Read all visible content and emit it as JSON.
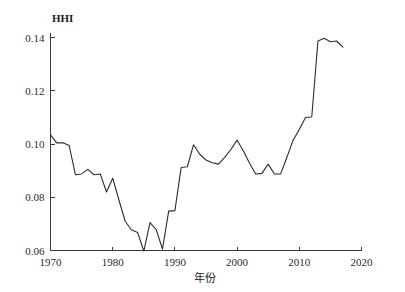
{
  "chart_data": {
    "type": "line",
    "title": "",
    "xlabel": "年份",
    "ylabel": "HHI",
    "xlim": [
      1970,
      2020
    ],
    "ylim": [
      0.06,
      0.142
    ],
    "grid": false,
    "legend": null,
    "x_ticks": [
      1970,
      1980,
      1990,
      2000,
      2010,
      2020
    ],
    "x_tick_labels": [
      "1970",
      "1980",
      "1990",
      "2000",
      "2010",
      "2020"
    ],
    "y_ticks": [
      0.06,
      0.08,
      0.1,
      0.12,
      0.14
    ],
    "y_tick_labels": [
      "0.06",
      "0.08",
      "0.10",
      "0.12",
      "0.14"
    ],
    "series": [
      {
        "name": "HHI",
        "color": "#2b2b2b",
        "x": [
          1970,
          1971,
          1972,
          1973,
          1974,
          1975,
          1976,
          1977,
          1978,
          1979,
          1980,
          1981,
          1982,
          1983,
          1984,
          1985,
          1986,
          1987,
          1988,
          1989,
          1990,
          1991,
          1992,
          1993,
          1994,
          1995,
          1996,
          1997,
          1998,
          1999,
          2000,
          2001,
          2002,
          2003,
          2004,
          2005,
          2006,
          2007,
          2008,
          2009,
          2010,
          2011,
          2012,
          2013,
          2014,
          2015,
          2016,
          2017
        ],
        "values": [
          0.1035,
          0.1005,
          0.1005,
          0.0995,
          0.0885,
          0.0888,
          0.0905,
          0.0885,
          0.0888,
          0.082,
          0.0872,
          0.079,
          0.071,
          0.0678,
          0.0668,
          0.0598,
          0.0705,
          0.0678,
          0.0605,
          0.0748,
          0.075,
          0.0912,
          0.0915,
          0.0998,
          0.0962,
          0.094,
          0.093,
          0.0925,
          0.095,
          0.098,
          0.1015,
          0.0975,
          0.0928,
          0.0888,
          0.089,
          0.0925,
          0.0888,
          0.0888,
          0.095,
          0.1015,
          0.1055,
          0.11,
          0.1102,
          0.1388,
          0.1398,
          0.1385,
          0.1388,
          0.1365
        ]
      }
    ]
  },
  "axes": {
    "y_title": "HHI",
    "x_title": "年份"
  }
}
